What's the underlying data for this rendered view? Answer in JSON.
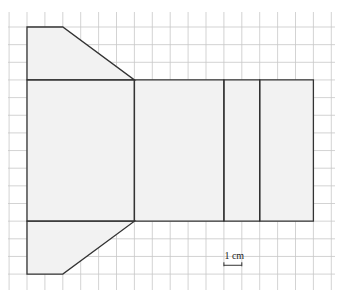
{
  "diagram": {
    "type": "net-on-grid",
    "grid": {
      "origin_px": [
        27,
        27
      ],
      "cell_w_px": 17.9,
      "cell_h_px": 17.65,
      "columns": 17,
      "rows": 14,
      "line_color": "#c8c8c8"
    },
    "colors": {
      "fill": "#f2f2f2",
      "edge": "#333333"
    },
    "faces": [
      {
        "name": "top-trapezoid",
        "points": [
          [
            0,
            0
          ],
          [
            2,
            0
          ],
          [
            6,
            3
          ],
          [
            0,
            3
          ]
        ]
      },
      {
        "name": "left-rectangle",
        "points": [
          [
            0,
            3
          ],
          [
            6,
            3
          ],
          [
            6,
            11
          ],
          [
            0,
            11
          ]
        ]
      },
      {
        "name": "middle-rectangle",
        "points": [
          [
            6,
            3
          ],
          [
            11,
            3
          ],
          [
            11,
            11
          ],
          [
            6,
            11
          ]
        ]
      },
      {
        "name": "narrow-rectangle",
        "points": [
          [
            11,
            3
          ],
          [
            13,
            3
          ],
          [
            13,
            11
          ],
          [
            11,
            11
          ]
        ]
      },
      {
        "name": "right-rectangle",
        "points": [
          [
            13,
            3
          ],
          [
            16,
            3
          ],
          [
            16,
            11
          ],
          [
            13,
            11
          ]
        ]
      },
      {
        "name": "bottom-trapezoid",
        "points": [
          [
            0,
            11
          ],
          [
            6,
            11
          ],
          [
            2,
            14
          ],
          [
            0,
            14
          ]
        ]
      }
    ],
    "scale": {
      "label": "1 cm",
      "from": [
        11,
        13.5
      ],
      "to": [
        12,
        13.5
      ]
    }
  }
}
